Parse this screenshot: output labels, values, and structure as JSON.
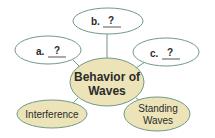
{
  "diagram": {
    "colors": {
      "outline": "#6f9a86",
      "connector": "#6f9a86",
      "fill_filled": "#ece4b8",
      "fill_empty": "#ffffff",
      "text": "#2b2b2b"
    },
    "center": {
      "line1": "Behavior of",
      "line2": "Waves"
    },
    "nodes": {
      "a": {
        "prefix": "a.",
        "blank": "?"
      },
      "b": {
        "prefix": "b.",
        "blank": "?"
      },
      "c": {
        "prefix": "c.",
        "blank": "?"
      },
      "interference": {
        "label": "Interference"
      },
      "standing": {
        "line1": "Standing",
        "line2": "Waves"
      }
    }
  }
}
